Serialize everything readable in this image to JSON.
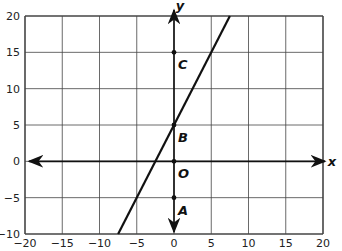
{
  "chart_data": {
    "type": "line",
    "title": "",
    "xlabel": "x",
    "ylabel": "y",
    "xlim": [
      -20,
      20
    ],
    "ylim": [
      -10,
      20
    ],
    "grid": true,
    "x_ticks": [
      "−20",
      "−15",
      "−10",
      "−5",
      "0",
      "5",
      "10",
      "15",
      "20"
    ],
    "y_ticks": [
      "−10",
      "−5",
      "0",
      "5",
      "10",
      "15",
      "20"
    ],
    "series": [
      {
        "name": "line",
        "equation": "y = 2x + 5",
        "x": [
          -7.5,
          7.5
        ],
        "y": [
          -10,
          20
        ]
      }
    ],
    "points": [
      {
        "label": "C",
        "x": 0,
        "y": 15
      },
      {
        "label": "B",
        "x": 0,
        "y": 5
      },
      {
        "label": "O",
        "x": 0,
        "y": 0
      },
      {
        "label": "A",
        "x": 0,
        "y": -5
      }
    ]
  },
  "axes": {
    "x_label": "x",
    "y_label": "y"
  }
}
